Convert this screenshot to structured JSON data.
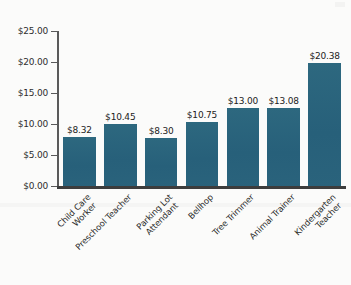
{
  "chart_data": {
    "type": "bar",
    "title": "",
    "subtitle": "",
    "xlabel": "",
    "ylabel": "",
    "ylim": [
      0,
      25
    ],
    "grid": false,
    "legend": false,
    "legend_position": "none",
    "bar_color": "#2a637c",
    "axis_color": "#5a5a5a",
    "baseline_color": "#3d3d3d",
    "background_color": "#fbfbfa",
    "value_label_format": "$0.00",
    "categories": [
      "Child Care Worker",
      "Preschool Teacher",
      "Parking Lot Attendant",
      "Bellhop",
      "Tree Trimmer",
      "Animal Trainer",
      "Kindergarten Teacher"
    ],
    "category_lines": [
      [
        "Child Care",
        "Worker"
      ],
      [
        "Preschool Teacher"
      ],
      [
        "Parking Lot",
        "Attendant"
      ],
      [
        "Bellhop"
      ],
      [
        "Tree Trimmer"
      ],
      [
        "Animal Trainer"
      ],
      [
        "Kindergarten",
        "Teacher"
      ]
    ],
    "values": [
      8.32,
      10.45,
      8.3,
      10.75,
      13.0,
      13.08,
      20.38
    ],
    "value_labels": [
      "$8.32",
      "$10.45",
      "$8.30",
      "$10.75",
      "$13.00",
      "$13.08",
      "$20.38"
    ],
    "y_ticks": [
      0,
      5,
      10,
      15,
      20,
      25
    ],
    "y_tick_labels": [
      "$0.00",
      "$5.00",
      "$10.00",
      "$15.00",
      "$20.00",
      "$25.00"
    ]
  },
  "axis": {
    "y_labels": {
      "t25": "$25.00",
      "t20": "$20.00",
      "t15": "$15.00",
      "t10": "$10.00",
      "t5": "$5.00",
      "t0": "$0.00"
    }
  },
  "bars": [
    {
      "label": "Child Care Worker",
      "value_text": "$8.32",
      "line1": "Child Care",
      "line2": "Worker"
    },
    {
      "label": "Preschool Teacher",
      "value_text": "$10.45",
      "line1": "Preschool Teacher",
      "line2": ""
    },
    {
      "label": "Parking Lot Attendant",
      "value_text": "$8.30",
      "line1": "Parking Lot",
      "line2": "Attendant"
    },
    {
      "label": "Bellhop",
      "value_text": "$10.75",
      "line1": "Bellhop",
      "line2": ""
    },
    {
      "label": "Tree Trimmer",
      "value_text": "$13.00",
      "line1": "Tree Trimmer",
      "line2": ""
    },
    {
      "label": "Animal Trainer",
      "value_text": "$13.08",
      "line1": "Animal Trainer",
      "line2": ""
    },
    {
      "label": "Kindergarten Teacher",
      "value_text": "$20.38",
      "line1": "Kindergarten",
      "line2": "Teacher"
    }
  ]
}
